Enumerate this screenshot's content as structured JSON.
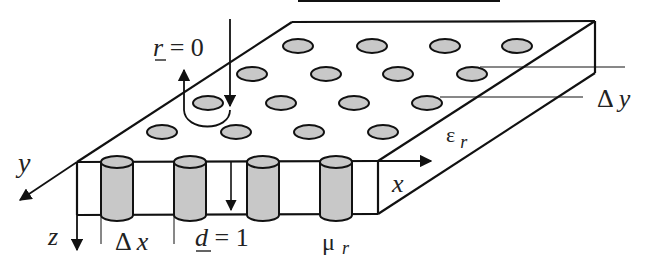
{
  "labels": {
    "reflection": "r = 0",
    "reflection_var": "r",
    "reflection_eq": " = 0",
    "y_axis": "y",
    "z_axis": "z",
    "x_axis": "x",
    "delta_x": "Δ x",
    "delta_y": "Δ y",
    "thickness": "d = 1",
    "thickness_var": "d",
    "thickness_eq": " = 1",
    "epsilon": "ε",
    "epsilon_sub": "r",
    "mu": "μ",
    "mu_sub": "r"
  },
  "colors": {
    "line": "#111111",
    "inclusion_fill": "#c8c8c8",
    "background": "#ffffff"
  },
  "inclusions": {
    "rows": [
      {
        "y": 46,
        "x": [
          298,
          372,
          445,
          517
        ]
      },
      {
        "y": 74,
        "x": [
          252,
          326,
          398,
          472
        ]
      },
      {
        "y": 103,
        "x": [
          208,
          281,
          354,
          427
        ]
      },
      {
        "y": 132,
        "x": [
          162,
          236,
          309,
          383
        ]
      }
    ],
    "front_cylinders_x": [
      117,
      190,
      263,
      336
    ]
  }
}
